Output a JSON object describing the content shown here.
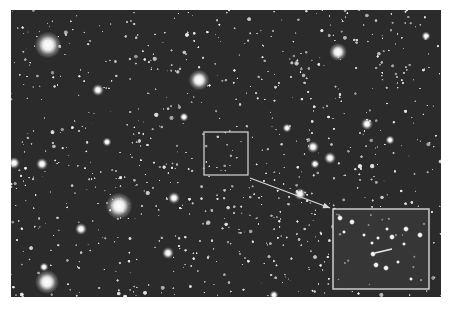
{
  "image": {
    "description": "Astronomical star field photograph with a small boxed region and an enlarged inset",
    "background": "#2b2b2b",
    "field": {
      "x": 11,
      "y": 10,
      "width": 430,
      "height": 287
    }
  },
  "annotations": {
    "source_box": {
      "x": 204,
      "y": 132,
      "width": 44,
      "height": 43,
      "color": "#d8d8d8"
    },
    "arrow": {
      "x1": 250,
      "y1": 178,
      "x2": 330,
      "y2": 208,
      "color": "#d8d8d8"
    },
    "inset_box": {
      "x": 333,
      "y": 209,
      "width": 96,
      "height": 80,
      "color": "#d8d8d8",
      "background": "#363636"
    },
    "inset_pointer": {
      "x1": 375,
      "y1": 253,
      "x2": 392,
      "y2": 249,
      "color": "#e8e8e8"
    }
  },
  "bright_stars": [
    {
      "x": 48,
      "y": 45,
      "r": 9
    },
    {
      "x": 199,
      "y": 80,
      "r": 7
    },
    {
      "x": 338,
      "y": 52,
      "r": 6
    },
    {
      "x": 119,
      "y": 206,
      "r": 9
    },
    {
      "x": 47,
      "y": 282,
      "r": 8
    },
    {
      "x": 426,
      "y": 36,
      "r": 3
    },
    {
      "x": 330,
      "y": 158,
      "r": 4
    },
    {
      "x": 367,
      "y": 124,
      "r": 4
    },
    {
      "x": 42,
      "y": 164,
      "r": 4
    },
    {
      "x": 14,
      "y": 163,
      "r": 4
    },
    {
      "x": 174,
      "y": 198,
      "r": 4
    },
    {
      "x": 300,
      "y": 194,
      "r": 4
    },
    {
      "x": 168,
      "y": 253,
      "r": 4
    },
    {
      "x": 98,
      "y": 90,
      "r": 4
    },
    {
      "x": 313,
      "y": 147,
      "r": 4
    },
    {
      "x": 184,
      "y": 117,
      "r": 3
    },
    {
      "x": 107,
      "y": 142,
      "r": 3
    },
    {
      "x": 81,
      "y": 229,
      "r": 4
    },
    {
      "x": 287,
      "y": 128,
      "r": 3
    },
    {
      "x": 315,
      "y": 164,
      "r": 3
    },
    {
      "x": 390,
      "y": 140,
      "r": 3
    },
    {
      "x": 274,
      "y": 295,
      "r": 3
    },
    {
      "x": 44,
      "y": 267,
      "r": 3
    }
  ],
  "inset_stars": [
    {
      "x": 340,
      "y": 218,
      "r": 3
    },
    {
      "x": 352,
      "y": 222,
      "r": 3
    },
    {
      "x": 344,
      "y": 232,
      "r": 2
    },
    {
      "x": 364,
      "y": 235,
      "r": 2
    },
    {
      "x": 372,
      "y": 243,
      "r": 2
    },
    {
      "x": 378,
      "y": 238,
      "r": 2
    },
    {
      "x": 392,
      "y": 237,
      "r": 3
    },
    {
      "x": 387,
      "y": 229,
      "r": 2
    },
    {
      "x": 406,
      "y": 229,
      "r": 3
    },
    {
      "x": 420,
      "y": 235,
      "r": 3
    },
    {
      "x": 373,
      "y": 254,
      "r": 3
    },
    {
      "x": 376,
      "y": 265,
      "r": 3
    },
    {
      "x": 386,
      "y": 268,
      "r": 3
    },
    {
      "x": 398,
      "y": 262,
      "r": 2
    },
    {
      "x": 411,
      "y": 279,
      "r": 2
    },
    {
      "x": 404,
      "y": 244,
      "r": 2
    }
  ],
  "random_seed": 7,
  "faint_star_count": 900
}
